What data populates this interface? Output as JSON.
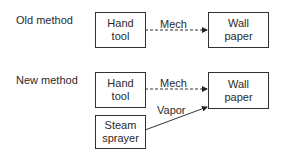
{
  "sections": [
    {
      "label": "Old method",
      "nodes": [
        {
          "id": "hand_tool",
          "text": "Hand\ntool"
        },
        {
          "id": "wall_paper",
          "text": "Wall\npaper"
        }
      ],
      "edges": [
        {
          "from": "hand_tool",
          "to": "wall_paper",
          "label": "Mech",
          "style": "dashed"
        }
      ]
    },
    {
      "label": "New method",
      "nodes": [
        {
          "id": "hand_tool",
          "text": "Hand\ntool"
        },
        {
          "id": "wall_paper",
          "text": "Wall\npaper"
        },
        {
          "id": "steam_sprayer",
          "text": "Steam\nsprayer"
        }
      ],
      "edges": [
        {
          "from": "hand_tool",
          "to": "wall_paper",
          "label": "Mech",
          "style": "dashed"
        },
        {
          "from": "steam_sprayer",
          "to": "wall_paper",
          "label": "Vapor",
          "style": "solid"
        }
      ]
    }
  ]
}
